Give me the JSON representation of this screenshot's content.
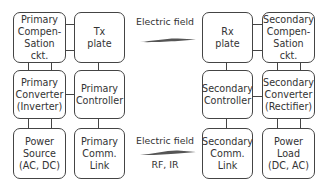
{
  "diagram": {
    "primary_side": {
      "compensation": "Primary\nCompen-\nSation ckt.",
      "tx_plate": "Tx\nplate",
      "converter": "Primary\nConverter\n(Inverter)",
      "controller": "Primary\nController",
      "power_source": "Power\nSource\n(AC, DC)",
      "comm_link": "Primary\nComm.\nLink"
    },
    "secondary_side": {
      "rx_plate": "Rx\nplate",
      "compensation": "Secondary\nCompen-\nSation ckt.",
      "controller": "Secondary\nController",
      "converter": "Secondary\nConverter\n(Rectifier)",
      "comm_link": "Secondary\nComm.\nLink",
      "power_load": "Power\nLoad\n(DC, AC)"
    },
    "links": {
      "power_link_label": "Electric field",
      "comm_link_label": "Electric field",
      "comm_link_sublabel": "RF, IR"
    },
    "colors": {
      "line": "#444444",
      "arrow": "#555555"
    }
  }
}
